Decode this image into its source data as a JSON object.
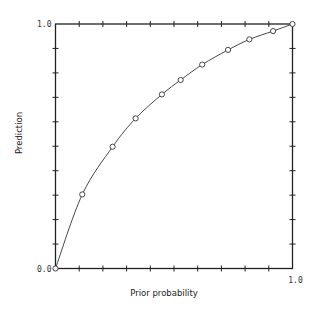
{
  "chart_data": {
    "type": "line",
    "title": "",
    "xlabel": "Prior probability",
    "ylabel": "Prediction",
    "xlim": [
      0,
      1
    ],
    "ylim": [
      0,
      1
    ],
    "grid": false,
    "legend": null,
    "x_tick_labels": [
      {
        "value": 1.0,
        "label": "1.0"
      }
    ],
    "y_tick_labels": [
      {
        "value": 0.0,
        "label": "0.0"
      },
      {
        "value": 1.0,
        "label": "1.0"
      }
    ],
    "minor_tick_step": 0.1,
    "frame": "box with ticks on all four sides",
    "series": [
      {
        "name": "Prediction curve",
        "marker": "open-circle",
        "line": "solid",
        "x": [
          0.0,
          0.113,
          0.241,
          0.338,
          0.449,
          0.528,
          0.619,
          0.728,
          0.818,
          0.918,
          1.0
        ],
        "y": [
          0.0,
          0.303,
          0.498,
          0.614,
          0.712,
          0.771,
          0.834,
          0.894,
          0.937,
          0.971,
          1.0
        ]
      }
    ],
    "colors": {
      "axis": "#222222",
      "line": "#333333",
      "marker_fill": "#ffffff"
    }
  }
}
